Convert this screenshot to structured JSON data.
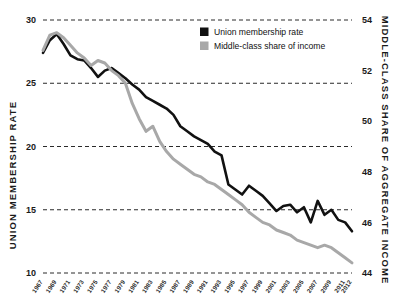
{
  "chart_data": {
    "type": "line",
    "title": "",
    "xlabel": "",
    "ylabel": "UNION MEMBERSHIP RATE",
    "y2label": "MIDDLE-CLASS SHARE OF AGGREGATE INCOME",
    "grid": true,
    "legend_position": "top-right",
    "ylim": [
      10,
      30
    ],
    "y2lim": [
      44,
      54
    ],
    "yticks": [
      10,
      15,
      20,
      25,
      30
    ],
    "y2ticks": [
      44,
      46,
      48,
      50,
      52,
      54
    ],
    "xlim": [
      1967,
      2012
    ],
    "x": [
      1967,
      1968,
      1969,
      1970,
      1971,
      1972,
      1973,
      1974,
      1975,
      1976,
      1977,
      1978,
      1979,
      1980,
      1981,
      1982,
      1983,
      1984,
      1985,
      1986,
      1987,
      1988,
      1989,
      1990,
      1991,
      1992,
      1993,
      1994,
      1995,
      1996,
      1997,
      1998,
      1999,
      2000,
      2001,
      2002,
      2003,
      2004,
      2005,
      2006,
      2007,
      2008,
      2009,
      2010,
      2011,
      2012
    ],
    "xtick_labels": [
      "1967",
      "1969",
      "1971",
      "1973",
      "1975",
      "1977",
      "1979",
      "1981",
      "1983",
      "1985",
      "1987",
      "1989",
      "1991",
      "1993",
      "1995",
      "1997",
      "1999",
      "2001",
      "2003",
      "2005",
      "2007",
      "2009",
      "2011",
      "2012"
    ],
    "series": [
      {
        "name": "Union membership rate",
        "color": "#111111",
        "axis": "left",
        "values": [
          27.4,
          28.4,
          28.9,
          28.1,
          27.2,
          26.9,
          26.8,
          26.2,
          25.5,
          26.0,
          26.2,
          25.8,
          25.4,
          24.9,
          24.5,
          23.9,
          23.6,
          23.3,
          23.0,
          22.5,
          21.6,
          21.2,
          20.8,
          20.5,
          20.2,
          19.6,
          19.3,
          17.0,
          16.6,
          16.2,
          16.9,
          16.5,
          16.1,
          15.5,
          14.9,
          15.3,
          15.4,
          14.8,
          15.2,
          14.0,
          15.7,
          14.6,
          15.0,
          14.2,
          14.0,
          13.3
        ]
      },
      {
        "name": "Middle-class share of income",
        "color": "#a8a8a8",
        "axis": "right",
        "values": [
          52.8,
          53.4,
          53.5,
          53.3,
          53.0,
          52.7,
          52.5,
          52.2,
          52.4,
          52.3,
          52.0,
          51.8,
          51.5,
          50.7,
          50.1,
          49.6,
          49.8,
          49.2,
          48.8,
          48.5,
          48.3,
          48.1,
          47.9,
          47.8,
          47.6,
          47.5,
          47.3,
          47.1,
          46.9,
          46.7,
          46.4,
          46.2,
          46.0,
          45.9,
          45.7,
          45.6,
          45.5,
          45.3,
          45.2,
          45.1,
          45.0,
          45.1,
          45.0,
          44.8,
          44.6,
          44.4
        ]
      }
    ]
  },
  "legend": {
    "items": [
      {
        "label": "Union membership rate",
        "swatch": "#111111"
      },
      {
        "label": "Middle-class share of income",
        "swatch": "#a8a8a8"
      }
    ]
  },
  "axes": {
    "left_title": "UNION MEMBERSHIP RATE",
    "right_title": "MIDDLE-CLASS SHARE OF AGGREGATE INCOME"
  }
}
